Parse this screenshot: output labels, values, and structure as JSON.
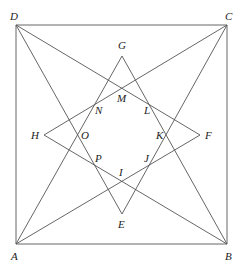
{
  "diagram": {
    "stroke_color": "#555555",
    "label_color": "#222222",
    "points": {
      "A": {
        "x": 16,
        "y": 244
      },
      "B": {
        "x": 227,
        "y": 244
      },
      "C": {
        "x": 227,
        "y": 25
      },
      "D": {
        "x": 16,
        "y": 25
      },
      "E": {
        "x": 122,
        "y": 214
      },
      "F": {
        "x": 200,
        "y": 135
      },
      "G": {
        "x": 122,
        "y": 56
      },
      "H": {
        "x": 44,
        "y": 135
      }
    },
    "labels": [
      {
        "text": "D",
        "x": 10,
        "y": 20
      },
      {
        "text": "C",
        "x": 225,
        "y": 20
      },
      {
        "text": "A",
        "x": 11,
        "y": 260
      },
      {
        "text": "B",
        "x": 225,
        "y": 260
      },
      {
        "text": "G",
        "x": 118,
        "y": 49
      },
      {
        "text": "E",
        "x": 118,
        "y": 228
      },
      {
        "text": "H",
        "x": 31,
        "y": 139
      },
      {
        "text": "F",
        "x": 205,
        "y": 139
      },
      {
        "text": "M",
        "x": 117,
        "y": 102
      },
      {
        "text": "N",
        "x": 95,
        "y": 114
      },
      {
        "text": "L",
        "x": 144,
        "y": 114
      },
      {
        "text": "O",
        "x": 81,
        "y": 139
      },
      {
        "text": "K",
        "x": 156,
        "y": 139
      },
      {
        "text": "P",
        "x": 95,
        "y": 162
      },
      {
        "text": "J",
        "x": 144,
        "y": 162
      },
      {
        "text": "I",
        "x": 119,
        "y": 176
      }
    ],
    "square": [
      "A",
      "B",
      "C",
      "D"
    ],
    "segments": [
      [
        "A",
        "G"
      ],
      [
        "B",
        "G"
      ],
      [
        "B",
        "H"
      ],
      [
        "C",
        "H"
      ],
      [
        "C",
        "E"
      ],
      [
        "D",
        "E"
      ],
      [
        "D",
        "F"
      ],
      [
        "A",
        "F"
      ]
    ]
  }
}
